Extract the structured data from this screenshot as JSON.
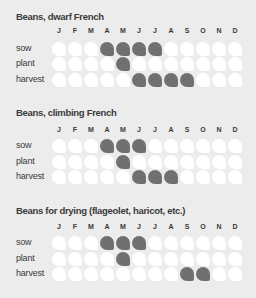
{
  "months": [
    "J",
    "F",
    "M",
    "A",
    "M",
    "J",
    "J",
    "A",
    "S",
    "O",
    "N",
    "D"
  ],
  "colors": {
    "background": "#ececec",
    "active": "#707070",
    "inactive": "#ffffff",
    "text": "#3a3a3a"
  },
  "sections": [
    {
      "title": "Beans, dwarf French",
      "rows": [
        {
          "label": "sow",
          "active": [
            0,
            0,
            0,
            1,
            1,
            1,
            1,
            0,
            0,
            0,
            0,
            0
          ]
        },
        {
          "label": "plant",
          "active": [
            0,
            0,
            0,
            0,
            1,
            0,
            0,
            0,
            0,
            0,
            0,
            0
          ]
        },
        {
          "label": "harvest",
          "active": [
            0,
            0,
            0,
            0,
            0,
            1,
            1,
            1,
            1,
            0,
            0,
            0
          ]
        }
      ]
    },
    {
      "title": "Beans, climbing French",
      "rows": [
        {
          "label": "sow",
          "active": [
            0,
            0,
            0,
            1,
            1,
            1,
            0,
            0,
            0,
            0,
            0,
            0
          ]
        },
        {
          "label": "plant",
          "active": [
            0,
            0,
            0,
            0,
            1,
            0,
            0,
            0,
            0,
            0,
            0,
            0
          ]
        },
        {
          "label": "harvest",
          "active": [
            0,
            0,
            0,
            0,
            0,
            1,
            1,
            1,
            0,
            0,
            0,
            0
          ]
        }
      ]
    },
    {
      "title": "Beans for drying (flageolet, haricot, etc.)",
      "rows": [
        {
          "label": "sow",
          "active": [
            0,
            0,
            0,
            1,
            1,
            1,
            0,
            0,
            0,
            0,
            0,
            0
          ]
        },
        {
          "label": "plant",
          "active": [
            0,
            0,
            0,
            0,
            1,
            0,
            0,
            0,
            0,
            0,
            0,
            0
          ]
        },
        {
          "label": "harvest",
          "active": [
            0,
            0,
            0,
            0,
            0,
            0,
            0,
            0,
            1,
            1,
            0,
            0
          ]
        }
      ]
    }
  ],
  "chart_data": {
    "type": "heatmap",
    "x": [
      "Jan",
      "Feb",
      "Mar",
      "Apr",
      "May",
      "Jun",
      "Jul",
      "Aug",
      "Sep",
      "Oct",
      "Nov",
      "Dec"
    ],
    "xticklabels": [
      "J",
      "F",
      "M",
      "A",
      "M",
      "J",
      "J",
      "A",
      "S",
      "O",
      "N",
      "D"
    ],
    "panels": [
      {
        "title": "Beans, dwarf French",
        "series": [
          {
            "name": "sow",
            "values": [
              0,
              0,
              0,
              1,
              1,
              1,
              1,
              0,
              0,
              0,
              0,
              0
            ]
          },
          {
            "name": "plant",
            "values": [
              0,
              0,
              0,
              0,
              1,
              0,
              0,
              0,
              0,
              0,
              0,
              0
            ]
          },
          {
            "name": "harvest",
            "values": [
              0,
              0,
              0,
              0,
              0,
              1,
              1,
              1,
              1,
              0,
              0,
              0
            ]
          }
        ]
      },
      {
        "title": "Beans, climbing French",
        "series": [
          {
            "name": "sow",
            "values": [
              0,
              0,
              0,
              1,
              1,
              1,
              0,
              0,
              0,
              0,
              0,
              0
            ]
          },
          {
            "name": "plant",
            "values": [
              0,
              0,
              0,
              0,
              1,
              0,
              0,
              0,
              0,
              0,
              0,
              0
            ]
          },
          {
            "name": "harvest",
            "values": [
              0,
              0,
              0,
              0,
              0,
              1,
              1,
              1,
              0,
              0,
              0,
              0
            ]
          }
        ]
      },
      {
        "title": "Beans for drying (flageolet, haricot, etc.)",
        "series": [
          {
            "name": "sow",
            "values": [
              0,
              0,
              0,
              1,
              1,
              1,
              0,
              0,
              0,
              0,
              0,
              0
            ]
          },
          {
            "name": "plant",
            "values": [
              0,
              0,
              0,
              0,
              1,
              0,
              0,
              0,
              0,
              0,
              0,
              0
            ]
          },
          {
            "name": "harvest",
            "values": [
              0,
              0,
              0,
              0,
              0,
              0,
              0,
              0,
              1,
              1,
              0,
              0
            ]
          }
        ]
      }
    ],
    "legend": "filled = active month, white = inactive"
  }
}
